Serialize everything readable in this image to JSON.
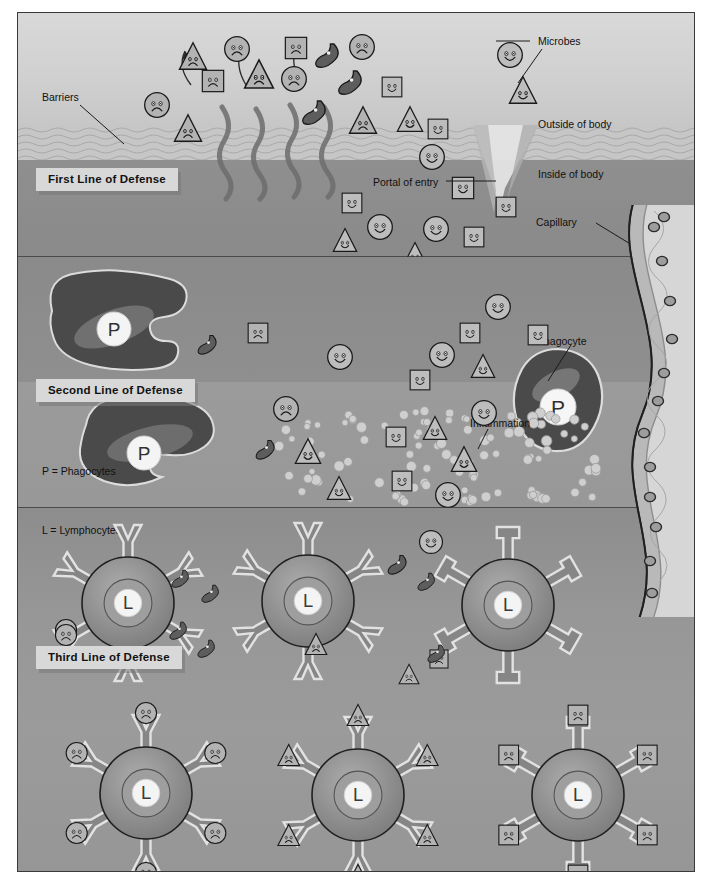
{
  "figure": {
    "domain": "immunology-diagram",
    "title_visible": false,
    "background": "#ffffff",
    "frame_border": "#3a3a3a"
  },
  "defense_boxes": [
    {
      "id": "first",
      "label": "First Line of Defense"
    },
    {
      "id": "second",
      "label": "Second Line of Defense"
    },
    {
      "id": "third",
      "label": "Third Line of Defense"
    }
  ],
  "legends": [
    {
      "id": "phagocyte-key",
      "label": "P = Phagocytes"
    },
    {
      "id": "lymphocyte-key",
      "label": "L = Lymphocytes"
    }
  ],
  "callouts": [
    {
      "id": "barriers",
      "label": "Barriers"
    },
    {
      "id": "microbes",
      "label": "Microbes"
    },
    {
      "id": "outside-body",
      "label": "Outside of body"
    },
    {
      "id": "inside-body",
      "label": "Inside of body"
    },
    {
      "id": "portal-entry",
      "label": "Portal of entry"
    },
    {
      "id": "capillary",
      "label": "Capillary"
    },
    {
      "id": "phagocyte",
      "label": "Phagocyte"
    },
    {
      "id": "inflammation",
      "label": "Inflammation"
    }
  ],
  "cell_glyphs": {
    "phagocyte_letter": "P",
    "lymphocyte_letter": "L"
  },
  "colors": {
    "outside_body": "#d4d4d4",
    "barrier_band": "#c3c3c3",
    "inside_body": "#8e8e8e",
    "second_line": "#939393",
    "third_line": "#989898",
    "phagocyte_body": "#4f4f4f",
    "lymphocyte_body": "#7d7d7d",
    "capillary_wall": "#6f6f6f",
    "capillary_lumen": "#cfcfcf",
    "label_box": "#d8d8d8",
    "text": "#111111",
    "outline": "#1a1a1a"
  },
  "band1_microbes": [
    {
      "shape": "triangle",
      "mood": "sad",
      "x": 160,
      "y": 28,
      "size": 30
    },
    {
      "shape": "circle",
      "mood": "sad",
      "x": 205,
      "y": 22,
      "size": 28
    },
    {
      "shape": "square",
      "mood": "sad",
      "x": 182,
      "y": 55,
      "size": 26
    },
    {
      "shape": "triangle",
      "mood": "sad",
      "x": 225,
      "y": 45,
      "size": 32
    },
    {
      "shape": "square",
      "mood": "sad",
      "x": 265,
      "y": 22,
      "size": 26
    },
    {
      "shape": "circle",
      "mood": "sad",
      "x": 262,
      "y": 52,
      "size": 28
    },
    {
      "shape": "comma",
      "mood": "sad",
      "x": 295,
      "y": 28,
      "size": 30
    },
    {
      "shape": "circle",
      "mood": "sad",
      "x": 330,
      "y": 20,
      "size": 28
    },
    {
      "shape": "comma",
      "mood": "sad",
      "x": 318,
      "y": 55,
      "size": 30
    },
    {
      "shape": "circle",
      "mood": "sad",
      "x": 125,
      "y": 78,
      "size": 28
    },
    {
      "shape": "triangle",
      "mood": "sad",
      "x": 155,
      "y": 100,
      "size": 30
    },
    {
      "shape": "square",
      "mood": "smile",
      "x": 362,
      "y": 62,
      "size": 24
    },
    {
      "shape": "circle",
      "mood": "smile",
      "x": 478,
      "y": 28,
      "size": 28
    },
    {
      "shape": "triangle",
      "mood": "smile",
      "x": 490,
      "y": 62,
      "size": 30
    },
    {
      "shape": "comma",
      "mood": "sad",
      "x": 282,
      "y": 85,
      "size": 30
    },
    {
      "shape": "triangle",
      "mood": "sad",
      "x": 330,
      "y": 92,
      "size": 30
    },
    {
      "shape": "triangle",
      "mood": "smile",
      "x": 378,
      "y": 92,
      "size": 28
    },
    {
      "shape": "square",
      "mood": "smile",
      "x": 408,
      "y": 104,
      "size": 24
    },
    {
      "shape": "circle",
      "mood": "smile",
      "x": 400,
      "y": 130,
      "size": 28
    },
    {
      "shape": "square",
      "mood": "smile",
      "x": 432,
      "y": 162,
      "size": 26
    },
    {
      "shape": "square",
      "mood": "smile",
      "x": 322,
      "y": 178,
      "size": 24
    },
    {
      "shape": "circle",
      "mood": "smile",
      "x": 348,
      "y": 200,
      "size": 28
    },
    {
      "shape": "triangle",
      "mood": "smile",
      "x": 314,
      "y": 214,
      "size": 26
    },
    {
      "shape": "circle",
      "mood": "smile",
      "x": 404,
      "y": 202,
      "size": 28
    },
    {
      "shape": "square",
      "mood": "smile",
      "x": 444,
      "y": 212,
      "size": 24
    },
    {
      "shape": "triangle",
      "mood": "smile",
      "x": 384,
      "y": 228,
      "size": 26
    },
    {
      "shape": "square",
      "mood": "smile",
      "x": 476,
      "y": 182,
      "size": 24
    }
  ],
  "band2_microbes": [
    {
      "shape": "square",
      "mood": "sad",
      "x": 228,
      "y": 308,
      "size": 24
    },
    {
      "shape": "comma",
      "mood": "sad",
      "x": 178,
      "y": 320,
      "size": 24
    },
    {
      "shape": "circle",
      "mood": "smile",
      "x": 308,
      "y": 330,
      "size": 28
    },
    {
      "shape": "circle",
      "mood": "smile",
      "x": 466,
      "y": 280,
      "size": 28
    },
    {
      "shape": "square",
      "mood": "smile",
      "x": 440,
      "y": 308,
      "size": 24
    },
    {
      "shape": "square",
      "mood": "smile",
      "x": 508,
      "y": 310,
      "size": 24
    },
    {
      "shape": "circle",
      "mood": "smile",
      "x": 410,
      "y": 328,
      "size": 28
    },
    {
      "shape": "square",
      "mood": "smile",
      "x": 390,
      "y": 355,
      "size": 24
    },
    {
      "shape": "triangle",
      "mood": "smile",
      "x": 452,
      "y": 340,
      "size": 26
    },
    {
      "shape": "circle",
      "mood": "sad",
      "x": 254,
      "y": 382,
      "size": 28
    },
    {
      "shape": "circle",
      "mood": "smile",
      "x": 452,
      "y": 386,
      "size": 28
    },
    {
      "shape": "comma",
      "mood": "sad",
      "x": 236,
      "y": 425,
      "size": 24
    },
    {
      "shape": "triangle",
      "mood": "smile",
      "x": 276,
      "y": 424,
      "size": 28
    },
    {
      "shape": "square",
      "mood": "smile",
      "x": 366,
      "y": 412,
      "size": 24
    },
    {
      "shape": "triangle",
      "mood": "smile",
      "x": 404,
      "y": 402,
      "size": 26
    },
    {
      "shape": "triangle",
      "mood": "smile",
      "x": 432,
      "y": 432,
      "size": 28
    },
    {
      "shape": "square",
      "mood": "smile",
      "x": 372,
      "y": 456,
      "size": 24
    },
    {
      "shape": "triangle",
      "mood": "smile",
      "x": 308,
      "y": 462,
      "size": 26
    },
    {
      "shape": "circle",
      "mood": "smile",
      "x": 416,
      "y": 468,
      "size": 28
    }
  ],
  "band3_free_microbes": [
    {
      "shape": "circle",
      "mood": "smile",
      "x": 400,
      "y": 516,
      "size": 26
    },
    {
      "shape": "comma",
      "mood": "sad",
      "x": 368,
      "y": 540,
      "size": 24
    },
    {
      "shape": "comma",
      "mood": "sad",
      "x": 398,
      "y": 558,
      "size": 22
    },
    {
      "shape": "comma",
      "mood": "sad",
      "x": 408,
      "y": 630,
      "size": 22
    },
    {
      "shape": "triangle",
      "mood": "sad",
      "x": 380,
      "y": 650,
      "size": 22
    },
    {
      "shape": "comma",
      "mood": "sad",
      "x": 182,
      "y": 570,
      "size": 22
    },
    {
      "shape": "comma",
      "mood": "sad",
      "x": 178,
      "y": 625,
      "size": 22
    },
    {
      "shape": "circle",
      "mood": "sad",
      "x": 36,
      "y": 610,
      "size": 24
    }
  ],
  "lymphocytes": [
    {
      "id": "L1",
      "receptor": "y",
      "x": 110,
      "y": 590,
      "bound": false
    },
    {
      "id": "L2",
      "receptor": "y",
      "x": 290,
      "y": 588,
      "bound": false
    },
    {
      "id": "L3",
      "receptor": "square",
      "x": 490,
      "y": 592,
      "bound": false
    },
    {
      "id": "L4",
      "receptor": "y",
      "x": 128,
      "y": 780,
      "bound": true,
      "bound_shape": "circle"
    },
    {
      "id": "L5",
      "receptor": "y",
      "x": 340,
      "y": 782,
      "bound": true,
      "bound_shape": "triangle"
    },
    {
      "id": "L6",
      "receptor": "square",
      "x": 560,
      "y": 782,
      "bound": true,
      "bound_shape": "square"
    }
  ],
  "phagocytes": [
    {
      "id": "P1",
      "x": 96,
      "y": 318,
      "engulfed": [
        "triangle",
        "circle",
        "square"
      ],
      "label": null
    },
    {
      "id": "P2",
      "x": 126,
      "y": 442,
      "engulfed": [
        "triangle",
        "circle"
      ],
      "label": null
    },
    {
      "id": "P3",
      "x": 520,
      "y": 372,
      "engulfed": [],
      "label": "Phagocyte"
    }
  ],
  "inflammation": {
    "label": "Inflammation",
    "bubble_count": 110,
    "region": {
      "x": 260,
      "y": 400,
      "w": 300,
      "h": 95
    }
  },
  "capillary": {
    "label": "Capillary",
    "nuclei_count": 13
  }
}
